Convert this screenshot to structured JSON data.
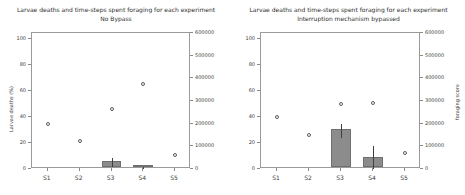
{
  "figure": {
    "width": 465,
    "height": 195,
    "background": "#ffffff",
    "bar_color": "#8c8c8c",
    "marker_color": "#5a5a5a",
    "axis_color": "#9a9a9a"
  },
  "chart_data": [
    {
      "type": "bar",
      "panel": "left",
      "title": "Larvae deaths and time-steps spent foraging for each experiment",
      "subtitle": "No Bypass",
      "xlabel": "",
      "ylabel": "Larvae deaths (%)",
      "y2label": "foraging score",
      "categories": [
        "S1",
        "S2",
        "S3",
        "S4",
        "S5"
      ],
      "ylim": [
        0,
        105
      ],
      "yticks": [
        0,
        20,
        40,
        60,
        80,
        100
      ],
      "y2lim": [
        0,
        600000
      ],
      "y2ticks": [
        0,
        100000,
        200000,
        300000,
        400000,
        500000,
        600000
      ],
      "grid": false,
      "legend": "none",
      "series": [
        {
          "name": "Larvae deaths (%)",
          "render": "bar",
          "axis": "left",
          "values": [
            0,
            0,
            5,
            0.6,
            0
          ],
          "errors": [
            0,
            0,
            3.2,
            0.8,
            0
          ]
        },
        {
          "name": "foraging score",
          "render": "marker",
          "axis": "right",
          "values": [
            200000,
            126000,
            263000,
            377000,
            63000
          ],
          "values_on_left_scale": [
            35,
            22,
            46,
            66,
            11
          ]
        }
      ]
    },
    {
      "type": "bar",
      "panel": "right",
      "title": "Larvae deaths and time-steps spent foraging for each experiment",
      "subtitle": "Interruption mechanism bypassed",
      "xlabel": "",
      "ylabel": "",
      "y2label": "foraging score",
      "categories": [
        "S1",
        "S2",
        "S3",
        "S4",
        "S5"
      ],
      "ylim": [
        0,
        105
      ],
      "yticks": [
        0,
        20,
        40,
        60,
        80,
        100
      ],
      "y2lim": [
        0,
        600000
      ],
      "y2ticks": [
        0,
        100000,
        200000,
        300000,
        400000,
        500000,
        600000
      ],
      "grid": false,
      "legend": "none",
      "series": [
        {
          "name": "Larvae deaths (%)",
          "render": "bar",
          "axis": "left",
          "values": [
            0,
            0,
            29.5,
            8,
            0
          ],
          "errors": [
            0,
            0,
            5.5,
            9.5,
            0
          ]
        },
        {
          "name": "foraging score",
          "render": "marker",
          "axis": "right",
          "values": [
            229000,
            149000,
            288000,
            292000,
            69000
          ],
          "values_on_left_scale": [
            40,
            26,
            50.5,
            51,
            12
          ]
        }
      ]
    }
  ]
}
